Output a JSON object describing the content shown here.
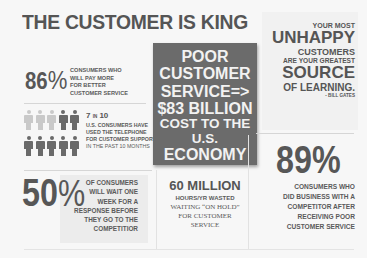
{
  "title": "THE CUSTOMER IS KING",
  "stat_86": {
    "value": "86%",
    "number": "86",
    "percent_sign": "%",
    "text_lines": [
      "CONSUMERS WHO",
      "WILL PAY MORE",
      "FOR BETTER",
      "CUSTOMER SERVICE"
    ]
  },
  "stat_7_in_10": {
    "header": "7 IN 10",
    "head_num": "7",
    "head_in": "IN",
    "head_den": "10",
    "text_lines": [
      "U.S. CONSUMERS HAVE",
      "USED THE TELEPHONE",
      "FOR CUSTOMER SUPPORT",
      "IN THE PAST 10 MONTHS"
    ],
    "icons": {
      "total": 10,
      "highlighted": 7,
      "rows": [
        [
          "light",
          "light",
          "light",
          "dark",
          "dark"
        ],
        [
          "dark",
          "dark",
          "dark",
          "dark",
          "dark"
        ]
      ]
    }
  },
  "cost_box": {
    "lines": [
      "POOR",
      "CUSTOMER",
      "SERVICE=>",
      "$83 BILLION",
      "COST TO THE U.S.",
      "ECONOMY"
    ],
    "background": "#6b6b6b"
  },
  "quote": {
    "lines": [
      "YOUR MOST",
      "UNHAPPY",
      "CUSTOMERS",
      "ARE YOUR GREATEST",
      "SOURCE",
      "OF LEARNING."
    ],
    "author": "- BILL GATES"
  },
  "stat_89": {
    "value": "89%",
    "text_lines": [
      "CONSUMERS WHO",
      "DID BUSINESS WITH A",
      "COMPETITOR AFTER",
      "RECEIVING POOR",
      "CUSTOMER SERVICE"
    ]
  },
  "stat_50": {
    "value": "50%",
    "number": "50",
    "percent_sign": "%",
    "text_lines": [
      "OF CONSUMERS",
      "WILL WAIT ONE",
      "WEEK FOR A",
      "RESPONSE BEFORE",
      "THEY GO TO THE",
      "COMPETITIOR"
    ]
  },
  "stat_60m": {
    "value": "60 MILLION",
    "subtitle": "HOURS/YR WASTED",
    "text_lines": [
      "WAITING “ON HOLD”",
      "FOR CUSTOMER",
      "SERVICE"
    ]
  }
}
